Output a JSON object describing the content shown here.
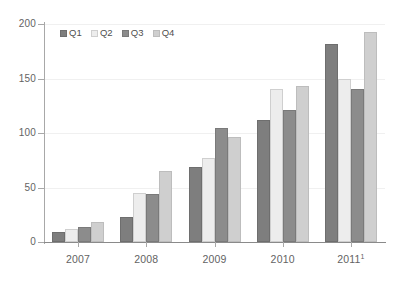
{
  "chart_data": {
    "type": "bar",
    "title": "",
    "subtitle": "",
    "xlabel": "",
    "ylabel": "",
    "ylim": [
      0,
      200
    ],
    "yticks": [
      0,
      50,
      100,
      150,
      200
    ],
    "ytick_labels": [
      "0",
      "50",
      "100",
      "150",
      "200"
    ],
    "grid": true,
    "grid_axis": "y",
    "legend_position": "top-left",
    "categories": [
      "2007",
      "2008",
      "2009",
      "2010",
      "2011"
    ],
    "category_labels": [
      "2007",
      "2008",
      "2009",
      "2010",
      "2011"
    ],
    "category_footnotes": [
      "",
      "",
      "",
      "",
      "1"
    ],
    "series": [
      {
        "name": "Q1",
        "color": "#7e7e7e",
        "values": [
          9,
          23,
          69,
          112,
          182
        ]
      },
      {
        "name": "Q2",
        "color": "#ededed",
        "values": [
          12,
          45,
          77,
          140,
          150
        ]
      },
      {
        "name": "Q3",
        "color": "#8c8c8c",
        "values": [
          14,
          44,
          105,
          121,
          140
        ]
      },
      {
        "name": "Q4",
        "color": "#cfcfcf",
        "values": [
          18,
          65,
          96,
          143,
          193
        ]
      }
    ]
  },
  "legend": {
    "items": [
      {
        "label": "Q1"
      },
      {
        "label": "Q2"
      },
      {
        "label": "Q3"
      },
      {
        "label": "Q4"
      }
    ]
  }
}
